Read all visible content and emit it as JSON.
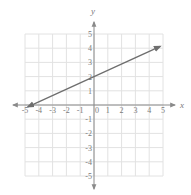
{
  "chart_data": {
    "type": "line",
    "title": "",
    "xlabel": "x",
    "ylabel": "y",
    "xlim": [
      -5,
      5
    ],
    "ylim": [
      -5,
      5
    ],
    "grid": true,
    "x_ticks": [
      -5,
      -4,
      -3,
      -2,
      -1,
      0,
      1,
      2,
      3,
      4,
      5
    ],
    "x_tick_labels": [
      "-5",
      "-4",
      "-3",
      "-2",
      "-1",
      "0",
      "1",
      "2",
      "3",
      "4",
      "5"
    ],
    "y_ticks": [
      5,
      4,
      3,
      2,
      1,
      -1,
      -2,
      -3,
      -4,
      -5
    ],
    "y_tick_labels": [
      "5",
      "4",
      "3",
      "2",
      "1",
      "-1",
      "-2",
      "-3",
      "-4",
      "-5"
    ],
    "series": [
      {
        "name": "line",
        "description": "Line with arrows on both ends, y-intercept 2, x-intercept about -4.5",
        "slope": 0.444,
        "intercept": 2,
        "x": [
          -4.8,
          4.8
        ],
        "y": [
          -0.13,
          4.13
        ],
        "arrows": "both"
      }
    ],
    "legend": null
  },
  "colors": {
    "grid": "#e2e2e2",
    "axis": "#8a8a8a",
    "line": "#6e6e6e",
    "text": "#7a7a7a"
  }
}
